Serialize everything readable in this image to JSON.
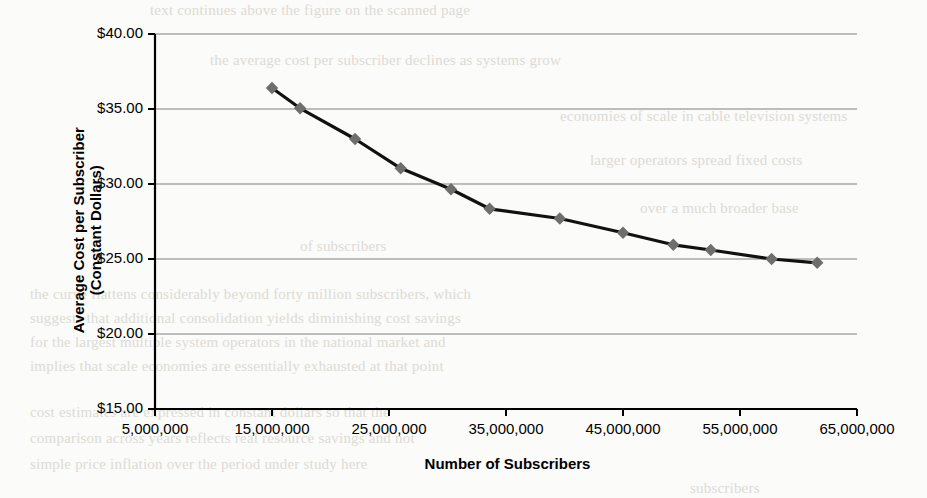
{
  "page": {
    "background_color": "#fbfbf9",
    "bleed_through_lines": [
      {
        "text": "text continues above the figure on the scanned page",
        "x": 150,
        "y": 2
      },
      {
        "text": "the average cost per subscriber declines as systems grow",
        "x": 210,
        "y": 52
      },
      {
        "text": "economies of scale in cable television systems",
        "x": 560,
        "y": 108
      },
      {
        "text": "larger operators spread fixed costs",
        "x": 590,
        "y": 152
      },
      {
        "text": "over a much broader base",
        "x": 640,
        "y": 200
      },
      {
        "text": "of subscribers",
        "x": 300,
        "y": 238
      },
      {
        "text": "the curve flattens considerably beyond forty million subscribers, which",
        "x": 30,
        "y": 286
      },
      {
        "text": "suggests that additional consolidation yields diminishing cost savings",
        "x": 30,
        "y": 310
      },
      {
        "text": "for the largest multiple system operators in the national market and",
        "x": 30,
        "y": 334
      },
      {
        "text": "implies that scale economies are essentially exhausted at that point",
        "x": 30,
        "y": 358
      },
      {
        "text": "cost estimates are expressed in constant dollars so that the",
        "x": 30,
        "y": 404
      },
      {
        "text": "comparison across years reflects real resource savings and not",
        "x": 30,
        "y": 430
      },
      {
        "text": "simple price inflation over the period under study here",
        "x": 30,
        "y": 456
      },
      {
        "text": "subscribers",
        "x": 690,
        "y": 480
      }
    ]
  },
  "chart_data": {
    "type": "line",
    "title": "",
    "xlabel": "Number of Subscribers",
    "ylabel": "Average Cost per Subscriber (Constant Dollars)",
    "ylabel_lines": [
      "Average Cost per Subscriber",
      "(Constant Dollars)"
    ],
    "xlim": [
      5000000,
      65000000
    ],
    "ylim": [
      15,
      40
    ],
    "grid": "horizontal",
    "legend": "none",
    "x_tick_labels": [
      "5,000,000",
      "15,000,000",
      "25,000,000",
      "35,000,000",
      "45,000,000",
      "55,000,000",
      "65,000,000"
    ],
    "x_tick_values": [
      5000000,
      15000000,
      25000000,
      35000000,
      45000000,
      55000000,
      65000000
    ],
    "y_tick_labels": [
      "$40.00",
      "$35.00",
      "$30.00",
      "$25.00",
      "$20.00",
      "$15.00"
    ],
    "y_tick_values": [
      40,
      35,
      30,
      25,
      20,
      15
    ],
    "series": [
      {
        "name": "Average cost per subscriber",
        "marker": "diamond",
        "marker_color": "#6e6e6e",
        "line_color": "#111111",
        "x": [
          15000000,
          17400000,
          22100000,
          26000000,
          30300000,
          33600000,
          39600000,
          45000000,
          49300000,
          52500000,
          57700000,
          61600000
        ],
        "y": [
          36.4,
          35.05,
          33.0,
          31.05,
          29.65,
          28.35,
          27.7,
          26.75,
          25.95,
          25.6,
          25.0,
          24.75
        ]
      }
    ]
  },
  "colors": {
    "axis": "#000000",
    "gridline": "#808080",
    "marker": "#6e6e6e",
    "line": "#111111"
  }
}
